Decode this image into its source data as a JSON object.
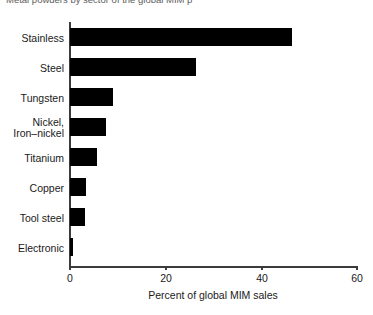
{
  "chart_data": {
    "type": "bar",
    "orientation": "horizontal",
    "title": "Metal powders by sector of the global MIM p",
    "xlabel": "Percent of global MIM sales",
    "ylabel": "",
    "categories": [
      "Stainless",
      "Steel",
      "Tungsten",
      "Nickel,\nIron–nickel",
      "Titanium",
      "Copper",
      "Tool steel",
      "Electronic"
    ],
    "values": [
      46.5,
      26.3,
      9.0,
      7.5,
      5.6,
      3.3,
      3.1,
      0.7
    ],
    "xlim": [
      0,
      60
    ],
    "xticks": [
      0,
      20,
      40,
      60
    ],
    "xtick_labels": [
      "0",
      "20",
      "40",
      "60"
    ],
    "grid": false,
    "legend": null,
    "bar_color": "#000000",
    "axis_color": "#3b3b3b",
    "background": "#ffffff"
  },
  "labels": {
    "stainless": "Stainless",
    "steel": "Steel",
    "tungsten": "Tungsten",
    "nickel_line1": "Nickel,",
    "nickel_line2": "Iron–nickel",
    "titanium": "Titanium",
    "copper": "Copper",
    "tool_steel": "Tool steel",
    "electronic": "Electronic"
  }
}
